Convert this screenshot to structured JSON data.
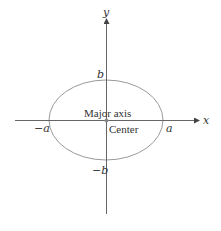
{
  "diagram": {
    "type": "ellipse-on-axes",
    "colors": {
      "axis": "#555555",
      "ellipse": "#9a9a9a",
      "text": "#333333",
      "center_dot": "#888888"
    },
    "axes": {
      "x_label": "x",
      "y_label": "y"
    },
    "ellipse": {
      "center": [
        106,
        120
      ],
      "rx": 57,
      "ry": 40
    },
    "labels": {
      "b_top": "b",
      "b_bottom": "−b",
      "a_left": "−a",
      "a_right": "a",
      "major_axis": "Major axis",
      "center": "Center"
    }
  }
}
